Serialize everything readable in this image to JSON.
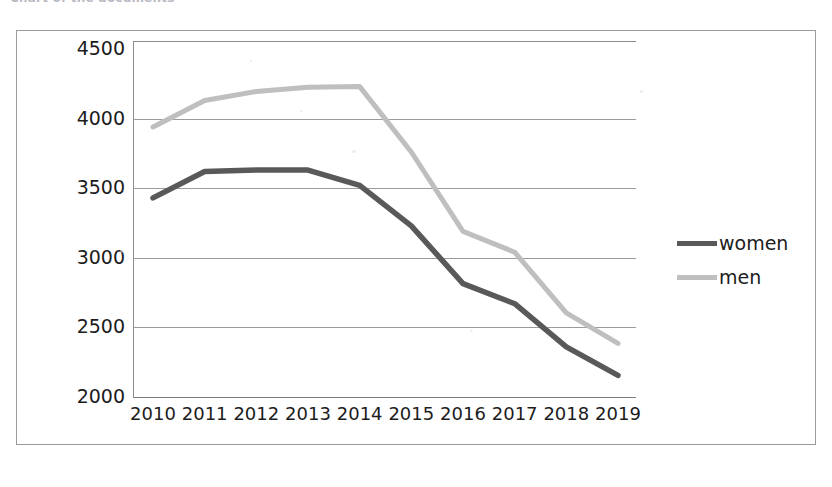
{
  "caption": {
    "text": "Chart of the documents"
  },
  "legend": {
    "position": "right",
    "items": [
      {
        "label": "women",
        "color": "#595959",
        "name": "legend-item-women"
      },
      {
        "label": "men",
        "color": "#bfbfbf",
        "name": "legend-item-men"
      }
    ]
  },
  "axes": {
    "y_ticks": [
      "4500",
      "4000",
      "3500",
      "3000",
      "2500",
      "2000"
    ],
    "x_ticks": [
      "2010",
      "2011",
      "2012",
      "2013",
      "2014",
      "2015",
      "2016",
      "2017",
      "2018",
      "2019"
    ]
  },
  "chart_data": {
    "type": "line",
    "title": "",
    "xlabel": "",
    "ylabel": "",
    "categories": [
      "2010",
      "2011",
      "2012",
      "2013",
      "2014",
      "2015",
      "2016",
      "2017",
      "2018",
      "2019"
    ],
    "series": [
      {
        "name": "women",
        "color": "#595959",
        "values": [
          3430,
          3620,
          3630,
          3630,
          3520,
          3230,
          2815,
          2670,
          2360,
          2155
        ]
      },
      {
        "name": "men",
        "color": "#bfbfbf",
        "values": [
          3940,
          4130,
          4195,
          4225,
          4230,
          3760,
          3190,
          3040,
          2605,
          2385
        ]
      }
    ],
    "ylim": [
      2000,
      4500
    ],
    "ytick_step": 500,
    "grid": true,
    "grid_axis": "y",
    "legend_position": "right"
  },
  "style": {
    "frame_border": "#9a9a9a",
    "grid_color": "#9b9b9b",
    "text_color": "#1c1c1c",
    "background": "#ffffff"
  }
}
